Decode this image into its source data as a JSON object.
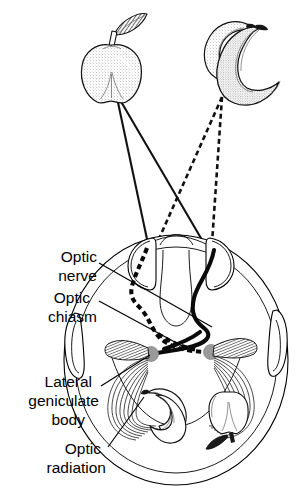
{
  "figure": {
    "kind": "anatomical-schematic",
    "view": "axial (horizontal) section of head, viewed from above"
  },
  "labels": [
    {
      "id": "optic-nerve",
      "lines": [
        "Optic",
        "nerve"
      ],
      "x": 97,
      "y": 256,
      "align": "end"
    },
    {
      "id": "optic-chiasm",
      "lines": [
        "Optic",
        "chiasm"
      ],
      "x": 97,
      "y": 295,
      "align": "end"
    },
    {
      "id": "lateral-geniculate",
      "lines": [
        "Lateral",
        "geniculate",
        "body"
      ],
      "x": 97,
      "y": 376,
      "align": "end"
    },
    {
      "id": "optic-radiation",
      "lines": [
        "Optic",
        "radiation"
      ],
      "x": 103,
      "y": 450,
      "align": "end"
    }
  ],
  "label_text": {
    "optic_nerve_1": "Optic",
    "optic_nerve_2": "nerve",
    "optic_chiasm_1": "Optic",
    "optic_chiasm_2": "chiasm",
    "lateral_geniculate_1": "Lateral",
    "lateral_geniculate_2": "geniculate",
    "lateral_geniculate_3": "body",
    "optic_radiation_1": "Optic",
    "optic_radiation_2": "radiation"
  },
  "stimuli": [
    {
      "id": "apple",
      "name": "apple",
      "position": "upper-left visual field",
      "ray_style": "solid",
      "apex": {
        "x": 116,
        "y": 93
      },
      "cortical_image": "right occipital cortex (inverted)"
    },
    {
      "id": "banana",
      "name": "banana",
      "position": "upper-right visual field",
      "ray_style": "dashed",
      "apex": {
        "x": 222,
        "y": 97
      },
      "cortical_image": "left occipital cortex (inverted)"
    }
  ],
  "structures": [
    {
      "id": "head-outline",
      "name": "head outline",
      "interactable": false
    },
    {
      "id": "left-ear",
      "name": "left ear",
      "interactable": false
    },
    {
      "id": "right-ear",
      "name": "right ear",
      "interactable": false
    },
    {
      "id": "left-eye",
      "name": "left eye (globe)",
      "interactable": false
    },
    {
      "id": "right-eye",
      "name": "right eye (globe)",
      "interactable": false
    },
    {
      "id": "optic-nerve-left",
      "name": "left optic nerve",
      "interactable": false
    },
    {
      "id": "optic-nerve-right",
      "name": "right optic nerve",
      "interactable": false
    },
    {
      "id": "optic-chiasm",
      "name": "optic chiasm",
      "interactable": false
    },
    {
      "id": "lgn-left",
      "name": "left lateral geniculate body",
      "interactable": false
    },
    {
      "id": "lgn-right",
      "name": "right lateral geniculate body",
      "interactable": false
    },
    {
      "id": "optic-radiation-left",
      "name": "left optic radiation",
      "interactable": false
    },
    {
      "id": "optic-radiation-right",
      "name": "right optic radiation",
      "interactable": false
    }
  ],
  "nodes": {
    "lgn_left": {
      "x": 151,
      "y": 354,
      "r": 7.5,
      "color": "#9a9a9a"
    },
    "lgn_right": {
      "x": 211,
      "y": 352,
      "r": 7.5,
      "color": "#9a9a9a"
    }
  },
  "colors": {
    "ink": "#000000",
    "paper": "#ffffff",
    "node_gray": "#9a9a9a",
    "shade_gray": "#4a4a4a"
  }
}
